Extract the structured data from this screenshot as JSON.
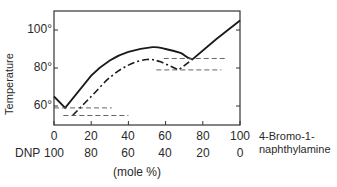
{
  "chart_data": {
    "type": "line",
    "title": "",
    "xlabel": "(mole %)",
    "ylabel": "Temperature",
    "x_axis_primary": {
      "label": "4-Bromo-1-naphthylamine",
      "ticks": [
        0,
        20,
        40,
        60,
        80,
        100
      ]
    },
    "x_axis_secondary": {
      "label": "DNP",
      "ticks": [
        100,
        80,
        60,
        40,
        20,
        0
      ]
    },
    "y_ticks": [
      "60°",
      "80°",
      "100°"
    ],
    "xlim": [
      0,
      100
    ],
    "ylim": [
      50,
      110
    ],
    "grid": false,
    "legend": "none",
    "series": [
      {
        "name": "liquidus (solid line)",
        "style": "solid",
        "points": [
          [
            0,
            65
          ],
          [
            6,
            59
          ],
          [
            20,
            76
          ],
          [
            30,
            84
          ],
          [
            40,
            88.5
          ],
          [
            53,
            91
          ],
          [
            60,
            90
          ],
          [
            68,
            88
          ],
          [
            75,
            85
          ],
          [
            87,
            95
          ],
          [
            100,
            105
          ]
        ]
      },
      {
        "name": "solidus (dash-dot line)",
        "style": "dash-dot",
        "points": [
          [
            10,
            55
          ],
          [
            20,
            65
          ],
          [
            30,
            75
          ],
          [
            40,
            81.5
          ],
          [
            50,
            84.5
          ],
          [
            58,
            83
          ],
          [
            67,
            79
          ],
          [
            75,
            85
          ]
        ]
      },
      {
        "name": "eutectic 1 upper (dashed)",
        "style": "dashed",
        "points": [
          [
            0,
            59
          ],
          [
            31,
            59
          ]
        ]
      },
      {
        "name": "eutectic 1 lower (dashed)",
        "style": "dashed",
        "points": [
          [
            5,
            55
          ],
          [
            40,
            55
          ]
        ]
      },
      {
        "name": "eutectic 2 upper (dashed)",
        "style": "dashed",
        "points": [
          [
            59,
            85
          ],
          [
            92,
            85
          ]
        ]
      },
      {
        "name": "eutectic 2 lower (dashed)",
        "style": "dashed",
        "points": [
          [
            55,
            79
          ],
          [
            90,
            79
          ]
        ]
      }
    ]
  },
  "labels": {
    "y_axis": "Temperature",
    "y_ticks": [
      "100°",
      "80°",
      "60°"
    ],
    "x_primary_ticks": [
      "0",
      "20",
      "40",
      "60",
      "80",
      "100"
    ],
    "x_secondary_name": "DNP",
    "x_secondary_ticks": [
      "100",
      "80",
      "60",
      "40",
      "20",
      "0"
    ],
    "compound_line1": "4-Bromo-1-",
    "compound_line2": "naphthylamine",
    "unit": "(mole %)"
  }
}
